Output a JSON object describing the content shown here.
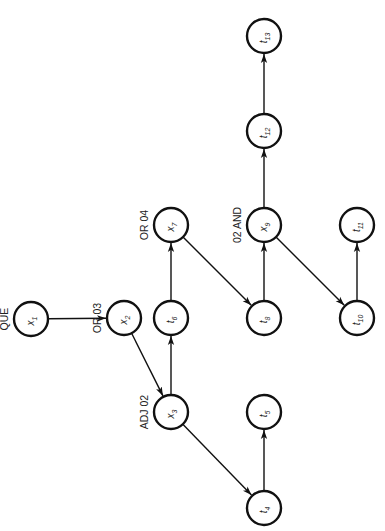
{
  "diagram": {
    "orientation": "rotated 90deg counter-clockwise",
    "radius": 17,
    "nodes": [
      {
        "id": "x1",
        "label": "x1",
        "main": "x",
        "sub": "1",
        "cx": 31,
        "cy": 319,
        "tag": "QUE"
      },
      {
        "id": "x2",
        "label": "x2",
        "main": "x",
        "sub": "2",
        "cx": 124,
        "cy": 318,
        "tag": "OR 03"
      },
      {
        "id": "x3",
        "label": "x3",
        "main": "x",
        "sub": "3",
        "cx": 171,
        "cy": 412,
        "tag": "ADJ 02"
      },
      {
        "id": "t4",
        "label": "t4",
        "main": "t",
        "sub": "4",
        "cx": 264,
        "cy": 508,
        "tag": ""
      },
      {
        "id": "t5",
        "label": "t5",
        "main": "t",
        "sub": "5",
        "cx": 264,
        "cy": 412,
        "tag": ""
      },
      {
        "id": "t6",
        "label": "t6",
        "main": "t",
        "sub": "6",
        "cx": 171,
        "cy": 318,
        "tag": ""
      },
      {
        "id": "x7",
        "label": "x7",
        "main": "x",
        "sub": "7",
        "cx": 171,
        "cy": 225,
        "tag": "OR 04"
      },
      {
        "id": "t8",
        "label": "t8",
        "main": "t",
        "sub": "8",
        "cx": 264,
        "cy": 318,
        "tag": ""
      },
      {
        "id": "x9",
        "label": "x9",
        "main": "x",
        "sub": "9",
        "cx": 264,
        "cy": 225,
        "tag": "02 AND"
      },
      {
        "id": "t10",
        "label": "t10",
        "main": "t",
        "sub": "10",
        "cx": 357,
        "cy": 318,
        "tag": ""
      },
      {
        "id": "t11",
        "label": "t11",
        "main": "t",
        "sub": "11",
        "cx": 357,
        "cy": 225,
        "tag": ""
      },
      {
        "id": "t12",
        "label": "t12",
        "main": "t",
        "sub": "12",
        "cx": 264,
        "cy": 131,
        "tag": ""
      },
      {
        "id": "t13",
        "label": "t13",
        "main": "t",
        "sub": "13",
        "cx": 264,
        "cy": 36,
        "tag": ""
      }
    ],
    "edges": [
      {
        "from": "x1",
        "to": "x2"
      },
      {
        "from": "x2",
        "to": "x3"
      },
      {
        "from": "x3",
        "to": "t6"
      },
      {
        "from": "x3",
        "to": "t4"
      },
      {
        "from": "t4",
        "to": "t5"
      },
      {
        "from": "t6",
        "to": "x7"
      },
      {
        "from": "x7",
        "to": "t8"
      },
      {
        "from": "t8",
        "to": "x9"
      },
      {
        "from": "x9",
        "to": "t12"
      },
      {
        "from": "t12",
        "to": "t13"
      },
      {
        "from": "x9",
        "to": "t10"
      },
      {
        "from": "t10",
        "to": "t11"
      }
    ]
  }
}
